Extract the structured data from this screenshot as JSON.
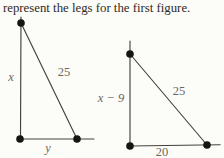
{
  "caption": "represent the legs for the first figure.",
  "first_triangle": {
    "vertical_leg_label": "x",
    "hypotenuse_label": "25",
    "horizontal_leg_label": "y"
  },
  "second_triangle": {
    "vertical_leg_label": "x − 9",
    "hypotenuse_label": "25",
    "horizontal_leg_label": "20"
  },
  "colors": {
    "background": "#fcfcf9",
    "caption_text": "#2e2b26",
    "line": "#45423b",
    "vertex_dot": "#161511",
    "side_label": "#6b685c"
  }
}
